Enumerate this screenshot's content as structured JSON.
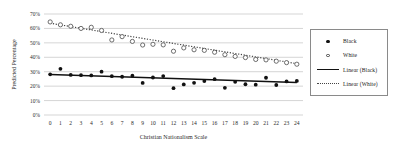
{
  "chart_data": {
    "type": "scatter",
    "title": "",
    "xlabel": "Christian Nationalism Scale",
    "ylabel": "Predicted Percentage",
    "xlim": [
      -0.6,
      24.6
    ],
    "ylim": [
      0,
      70
    ],
    "grid": true,
    "grid_axis": "y",
    "legend_position": "right",
    "ytick_labels": [
      "0%",
      "10%",
      "20%",
      "30%",
      "40%",
      "50%",
      "60%",
      "70%"
    ],
    "ytick_values": [
      0,
      10,
      20,
      30,
      40,
      50,
      60,
      70
    ],
    "xtick_labels": [
      "0",
      "1",
      "2",
      "3",
      "4",
      "5",
      "6",
      "7",
      "8",
      "9",
      "10",
      "11",
      "12",
      "13",
      "14",
      "15",
      "16",
      "17",
      "18",
      "19",
      "20",
      "21",
      "22",
      "23",
      "24"
    ],
    "x": [
      0,
      1,
      2,
      3,
      4,
      5,
      6,
      7,
      8,
      9,
      10,
      11,
      12,
      13,
      14,
      15,
      16,
      17,
      18,
      19,
      20,
      21,
      22,
      23,
      24
    ],
    "series": [
      {
        "name": "Black",
        "marker": "filled-circle",
        "color": "#111111",
        "values": [
          28.2,
          32.0,
          27.8,
          27.6,
          27.4,
          30.0,
          26.9,
          26.5,
          27.2,
          22.2,
          26.0,
          27.0,
          18.6,
          21.2,
          22.3,
          23.5,
          24.8,
          18.8,
          23.0,
          21.3,
          21.0,
          25.8,
          20.8,
          23.3,
          23.6
        ]
      },
      {
        "name": "White",
        "marker": "open-circle",
        "color": "#4a4a4a",
        "values": [
          64.5,
          62.5,
          61.5,
          60.0,
          60.8,
          58.6,
          52.0,
          54.3,
          51.0,
          48.5,
          49.0,
          48.6,
          44.2,
          46.5,
          45.2,
          44.8,
          43.5,
          41.8,
          40.6,
          39.8,
          38.5,
          38.2,
          37.3,
          36.3,
          35.2
        ]
      }
    ],
    "trendlines": [
      {
        "name": "Linear (Black)",
        "style": "solid",
        "color": "#111111",
        "x_start": 0,
        "y_start": 28.0,
        "x_end": 24,
        "y_end": 22.6
      },
      {
        "name": "Linear (White)",
        "style": "dotted",
        "color": "#444444",
        "x_start": 0,
        "y_start": 63.6,
        "x_end": 24,
        "y_end": 35.6
      }
    ],
    "legend_entries": [
      {
        "label": "Black",
        "key": "filled-circle"
      },
      {
        "label": "White",
        "key": "open-circle"
      },
      {
        "label": "Linear (Black)",
        "key": "solid-line"
      },
      {
        "label": "Linear (White)",
        "key": "dotted-line"
      }
    ]
  }
}
